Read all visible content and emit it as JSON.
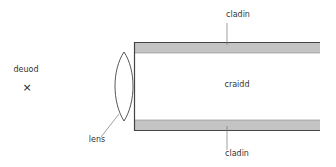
{
  "diagram": {
    "type": "optical-fibre-cross-section",
    "labels": {
      "cladding_top": "cladin",
      "cladding_bottom": "cladin",
      "core": "craidd",
      "lens": "lens",
      "source": "deuod",
      "source_marker": "×"
    },
    "colors": {
      "cladding_fill": "#c4c4c4",
      "outline": "#444444",
      "leader": "#777777",
      "text": "#333333"
    }
  }
}
